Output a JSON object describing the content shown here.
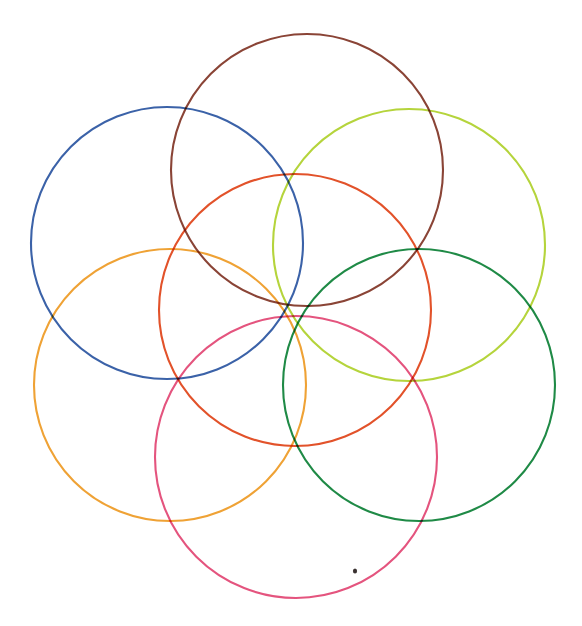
{
  "figure": {
    "background_color": "#ffffff",
    "canvas": {
      "width": 582,
      "height": 626
    }
  },
  "chart_data": {
    "type": "scatter",
    "subtitle": "",
    "xlabel": "",
    "ylabel": "",
    "xlim": [
      0,
      582
    ],
    "ylim": [
      0,
      626
    ],
    "grid": false,
    "legend": "none",
    "annotations": [
      {
        "name": "centre-node",
        "x": 293,
        "y": 308,
        "label": "common intersection point of all six outer circles"
      },
      {
        "name": "ink-speck",
        "x": 355,
        "y": 571,
        "label": "small dark speck artefact"
      }
    ],
    "series": [
      {
        "name": "centre-circle",
        "color": "#e2522a",
        "cx": 295,
        "cy": 310,
        "r": 136,
        "stroke_width": 2.1,
        "position": "centre"
      },
      {
        "name": "top-circle",
        "color": "#8a4436",
        "cx": 307,
        "cy": 170,
        "r": 136,
        "stroke_width": 2.1,
        "position": "top"
      },
      {
        "name": "upper-left-circle",
        "color": "#3b62a8",
        "cx": 167,
        "cy": 243,
        "r": 136,
        "stroke_width": 2.1,
        "position": "upper-left"
      },
      {
        "name": "upper-right-circle",
        "color": "#b5d43c",
        "cx": 409,
        "cy": 245,
        "r": 136,
        "stroke_width": 2.1,
        "position": "upper-right"
      },
      {
        "name": "lower-left-circle",
        "color": "#efa235",
        "cx": 170,
        "cy": 385,
        "r": 136,
        "stroke_width": 2.1,
        "position": "lower-left"
      },
      {
        "name": "lower-right-circle",
        "color": "#1f8a46",
        "cx": 419,
        "cy": 385,
        "r": 136,
        "stroke_width": 2.1,
        "position": "lower-right"
      },
      {
        "name": "bottom-circle",
        "color": "#e4547e",
        "cx": 296,
        "cy": 457,
        "r": 141,
        "stroke_width": 2.1,
        "position": "bottom"
      }
    ]
  },
  "palette": {
    "centre": "#e2522a",
    "top": "#8a4436",
    "upper_left": "#3b62a8",
    "upper_right": "#b5d43c",
    "lower_left": "#efa235",
    "lower_right": "#1f8a46",
    "bottom": "#e4547e",
    "speck": "#3a3230",
    "background": "#ffffff"
  }
}
